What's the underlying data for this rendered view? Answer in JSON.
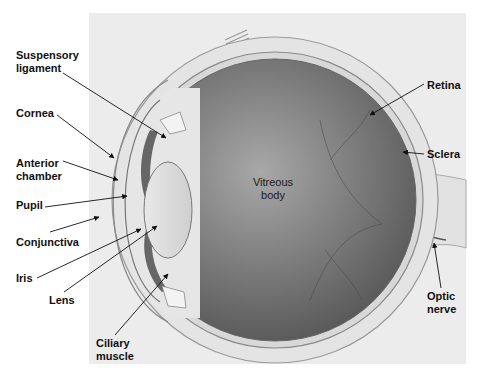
{
  "figure": {
    "panel_color": "#ececec",
    "vitreous_color": "#6e6e6e",
    "labels": [
      {
        "id": "suspensory-ligament",
        "text": "Suspensory\nligament",
        "x": 16,
        "y": 49
      },
      {
        "id": "cornea",
        "text": "Cornea",
        "x": 16,
        "y": 107
      },
      {
        "id": "anterior-chamber",
        "text": "Anterior\nchamber",
        "x": 16,
        "y": 157
      },
      {
        "id": "pupil",
        "text": "Pupil",
        "x": 16,
        "y": 199
      },
      {
        "id": "conjunctiva",
        "text": "Conjunctiva",
        "x": 16,
        "y": 236
      },
      {
        "id": "iris",
        "text": "Iris",
        "x": 16,
        "y": 273
      },
      {
        "id": "lens",
        "text": "Lens",
        "x": 49,
        "y": 296
      },
      {
        "id": "ciliary-muscle",
        "text": "Ciliary\nmuscle",
        "x": 96,
        "y": 339
      },
      {
        "id": "retina",
        "text": "Retina",
        "x": 427,
        "y": 79
      },
      {
        "id": "sclera",
        "text": "Sclera",
        "x": 427,
        "y": 148
      },
      {
        "id": "optic-nerve",
        "text": "Optic\nnerve",
        "x": 427,
        "y": 291
      },
      {
        "id": "vitreous-body",
        "text": "Vitreous\nbody",
        "x": 250,
        "y": 176
      }
    ]
  }
}
